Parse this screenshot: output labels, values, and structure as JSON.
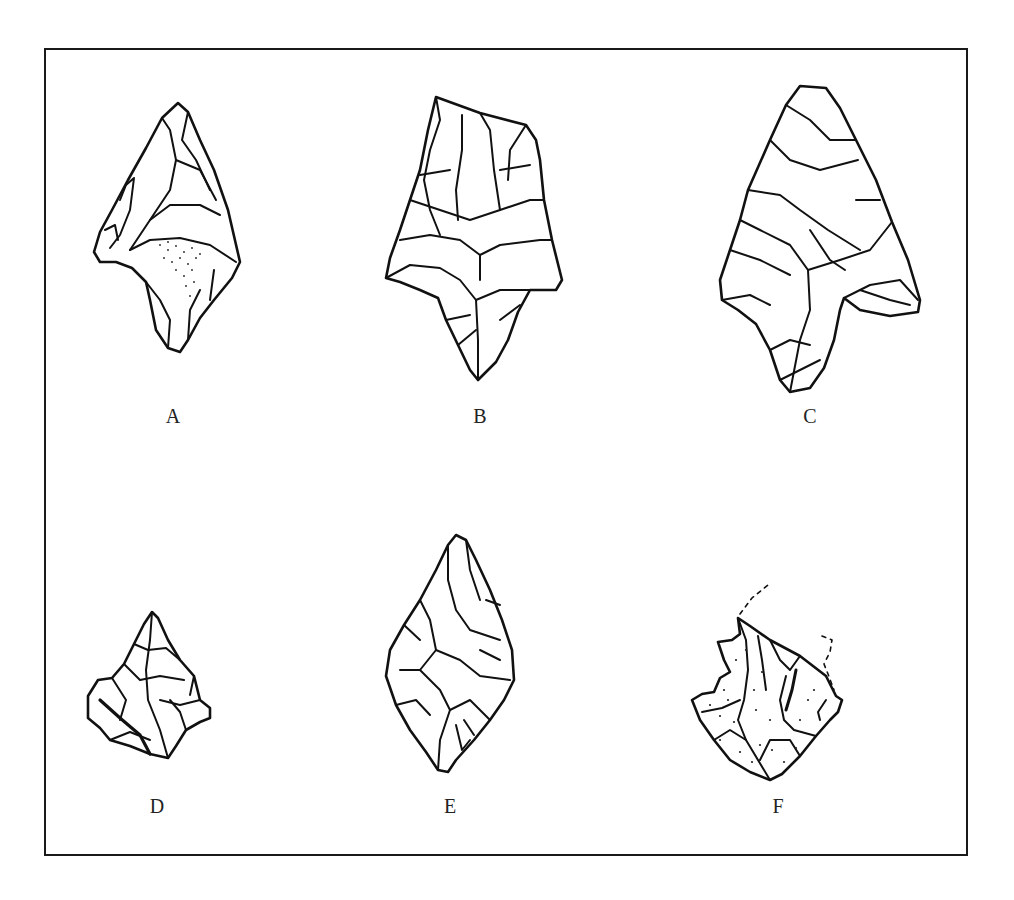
{
  "figure": {
    "type": "lithic artifact illustration plate",
    "border_color": "#1a1a1a",
    "line_color": "#111111",
    "background": "#ffffff",
    "items": [
      {
        "label": "A"
      },
      {
        "label": "B"
      },
      {
        "label": "C"
      },
      {
        "label": "D"
      },
      {
        "label": "E"
      },
      {
        "label": "F"
      }
    ]
  }
}
